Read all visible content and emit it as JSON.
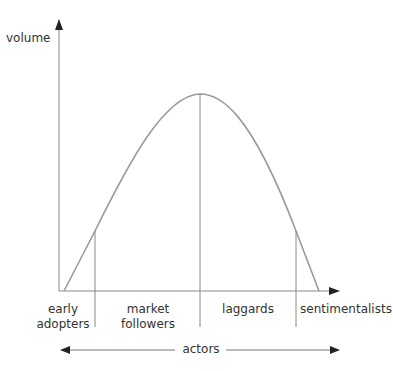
{
  "diagram": {
    "y_axis_label": "volume",
    "x_axis_label": "actors",
    "segments": [
      {
        "line1": "early",
        "line2": "adopters"
      },
      {
        "line1": "market",
        "line2": "followers"
      },
      {
        "line1": "laggards",
        "line2": ""
      },
      {
        "line1": "sentimentalists",
        "line2": ""
      }
    ],
    "colors": {
      "axis": "#555555",
      "curve": "#9a9a9a",
      "divider": "#8a8a8a",
      "text": "#333333"
    }
  }
}
